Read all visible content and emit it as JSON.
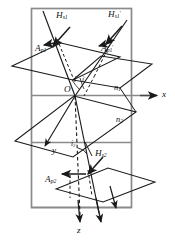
{
  "figure": {
    "type": "optics-refraction-diagram",
    "title": "",
    "colors": {
      "frame": "#8a8a8a",
      "stroke": "#1a1a1a",
      "background": "#ffffff",
      "label": "#111111"
    }
  },
  "labels": {
    "h_s1": {
      "text": "H",
      "sub": "s1",
      "sup": "",
      "x": 56,
      "y": 17
    },
    "h_s1_prime": {
      "text": "H",
      "sub": "s1",
      "sup": "′",
      "x": 110,
      "y": 16
    },
    "a_p1": {
      "text": "A",
      "sub": "p1",
      "sup": "",
      "x": 37,
      "y": 48
    },
    "a_p1_prime": {
      "text": "A",
      "sub": "p1",
      "sup": "′",
      "x": 103,
      "y": 48
    },
    "angle_i": {
      "text": "i",
      "sub": "",
      "sup": "",
      "x": 75,
      "y": 78
    },
    "angle_i_prime": {
      "text": "i",
      "sub": "",
      "sup": "′",
      "x": 83,
      "y": 78
    },
    "origin_o": {
      "text": "O",
      "sub": "",
      "sup": "",
      "x": 66,
      "y": 90
    },
    "n1": {
      "text": "n",
      "sub": "1",
      "sup": "",
      "x": 116,
      "y": 89
    },
    "axis_x": {
      "text": "x",
      "sub": "",
      "sup": "",
      "x": 163,
      "y": 96
    },
    "n2": {
      "text": "n",
      "sub": "2",
      "sup": "",
      "x": 118,
      "y": 121
    },
    "axis_y": {
      "text": "y",
      "sub": "",
      "sup": "",
      "x": 54,
      "y": 152
    },
    "angle_i2": {
      "text": "i",
      "sub": "2",
      "sup": "",
      "x": 74,
      "y": 147
    },
    "h_s2": {
      "text": "H",
      "sub": "s2",
      "sup": "",
      "x": 96,
      "y": 155
    },
    "a_p2": {
      "text": "A",
      "sub": "p2",
      "sup": "",
      "x": 47,
      "y": 180
    },
    "axis_z": {
      "text": "z",
      "sub": "",
      "sup": "",
      "x": 78,
      "y": 230
    }
  },
  "geometry": {
    "frame": {
      "x": 31,
      "y": 8,
      "width": 101,
      "height": 200
    },
    "interface_line": {
      "x1": 31,
      "y1": 95,
      "x2": 155,
      "y2": 95
    },
    "origin": {
      "x": 74,
      "y": 96
    },
    "axes": {
      "x_arrow_end": {
        "x": 158,
        "y": 95
      },
      "y_arrow_end": {
        "x": 48,
        "y": 148
      },
      "z_arrow_end": {
        "x": 75,
        "y": 224
      }
    },
    "upper_plane": {
      "points": "12,65 62,43 120,56 72,80"
    },
    "middle_plane": {
      "points": "16,141 74,96 135,112 72,157"
    },
    "lower_plane": {
      "points": "57,188 108,169 155,181 104,200"
    },
    "incident_ray": {
      "x1": 44,
      "y1": 12,
      "x2": 74,
      "y2": 96
    },
    "reflected_ray": {
      "x1": 74,
      "y1": 96,
      "x2": 126,
      "y2": 20
    },
    "refracted_ray": {
      "x1": 74,
      "y1": 96,
      "x2": 98,
      "y2": 210
    },
    "normal_dashed": {
      "x1": 74,
      "y1": 40,
      "x2": 79,
      "y2": 222
    },
    "transmitted_ray": {
      "x1": 74,
      "y1": 96,
      "x2": 42,
      "y2": 150
    }
  }
}
